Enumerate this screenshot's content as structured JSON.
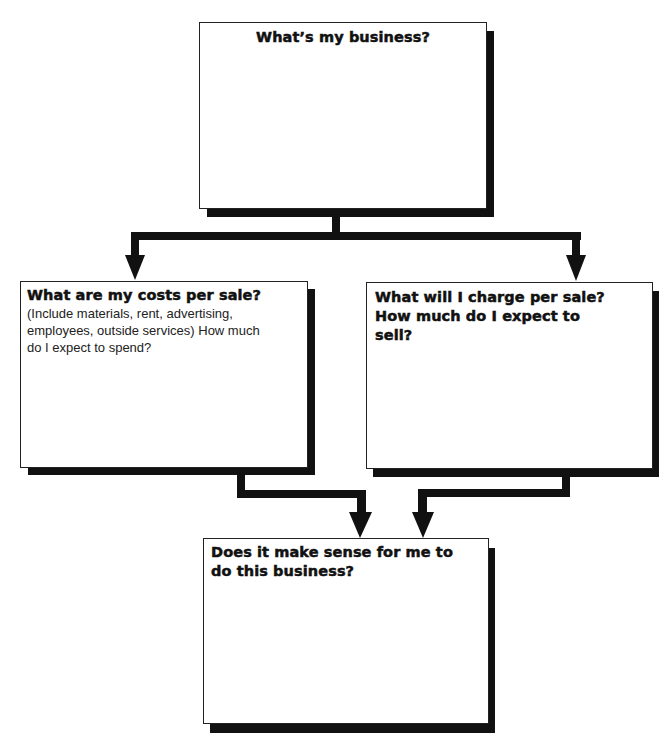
{
  "diagram": {
    "type": "flowchart",
    "nodes": [
      {
        "id": "business",
        "title": "What’s my business?",
        "body": ""
      },
      {
        "id": "costs",
        "title": "What are my costs per sale?",
        "body": "(Include materials, rent, advertising, employees, outside services) How much do I expect to spend?"
      },
      {
        "id": "revenue",
        "title": "What will I charge per sale? How much do I expect to sell?",
        "body": ""
      },
      {
        "id": "decision",
        "title": "Does it make sense for me to do this business?",
        "body": ""
      }
    ],
    "edges": [
      {
        "from": "business",
        "to": "costs"
      },
      {
        "from": "business",
        "to": "revenue"
      },
      {
        "from": "costs",
        "to": "decision"
      },
      {
        "from": "revenue",
        "to": "decision"
      }
    ],
    "colors": {
      "line": "#111111",
      "box_fill": "#ffffff",
      "shadow": "#111111"
    }
  }
}
